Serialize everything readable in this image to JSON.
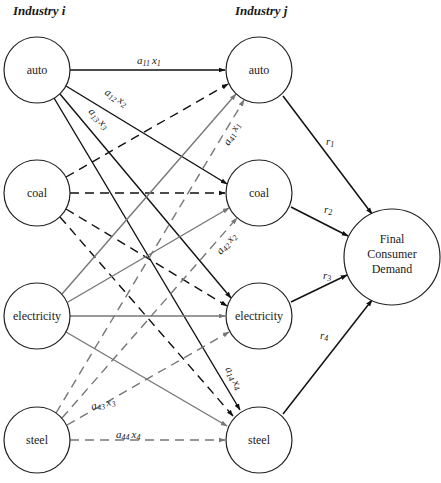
{
  "headers": {
    "left": "Industry i",
    "right": "Industry j"
  },
  "nodes": {
    "left": [
      {
        "id": "auto_i",
        "label": "auto",
        "cx": 37,
        "cy": 70
      },
      {
        "id": "coal_i",
        "label": "coal",
        "cx": 37,
        "cy": 193
      },
      {
        "id": "electricity_i",
        "label": "electricity",
        "cx": 37,
        "cy": 316
      },
      {
        "id": "steel_i",
        "label": "steel",
        "cx": 37,
        "cy": 440
      }
    ],
    "right": [
      {
        "id": "auto_j",
        "label": "auto",
        "cx": 259,
        "cy": 70
      },
      {
        "id": "coal_j",
        "label": "coal",
        "cx": 259,
        "cy": 193
      },
      {
        "id": "electricity_j",
        "label": "electricity",
        "cx": 259,
        "cy": 316
      },
      {
        "id": "steel_j",
        "label": "steel",
        "cx": 259,
        "cy": 440
      }
    ],
    "final": {
      "id": "final_demand",
      "label_lines": [
        "Final",
        "Consumer",
        "Demand"
      ],
      "cx": 392,
      "cy": 257
    }
  },
  "edge_styles": {
    "auto": {
      "color": "#111111",
      "dash": "none"
    },
    "coal": {
      "color": "#111111",
      "dash": "9,6"
    },
    "electricity": {
      "color": "#777777",
      "dash": "none"
    },
    "steel": {
      "color": "#777777",
      "dash": "9,6"
    },
    "final": {
      "color": "#111111",
      "dash": "none"
    }
  },
  "edge_labels": {
    "a11x1": {
      "a": "a",
      "sub1": "11",
      "x": "x",
      "sub2": "1"
    },
    "a12x2": {
      "a": "a",
      "sub1": "12",
      "x": "x",
      "sub2": "2"
    },
    "a13x3": {
      "a": "a",
      "sub1": "13",
      "x": "x",
      "sub2": "3"
    },
    "a14x4": {
      "a": "a",
      "sub1": "14",
      "x": "x",
      "sub2": "4"
    },
    "a41x1": {
      "a": "a",
      "sub1": "41",
      "x": "x",
      "sub2": "1"
    },
    "a42x2": {
      "a": "a",
      "sub1": "42",
      "x": "x",
      "sub2": "2"
    },
    "a43x3": {
      "a": "a",
      "sub1": "43",
      "x": "x",
      "sub2": "3"
    },
    "a44x4": {
      "a": "a",
      "sub1": "44",
      "x": "x",
      "sub2": "4"
    },
    "r1": {
      "r": "r",
      "sub": "1"
    },
    "r2": {
      "r": "r",
      "sub": "2"
    },
    "r3": {
      "r": "r",
      "sub": "3"
    },
    "r4": {
      "r": "r",
      "sub": "4"
    }
  }
}
